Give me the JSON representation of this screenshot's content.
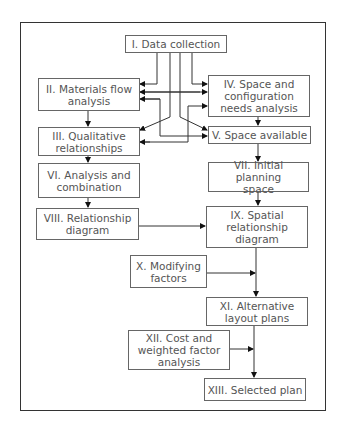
{
  "diagram": {
    "type": "flowchart",
    "nodes": [
      {
        "id": "I",
        "label": "I. Data collection"
      },
      {
        "id": "II",
        "label": "II. Materials flow\nanalysis"
      },
      {
        "id": "III",
        "label": "III. Qualitative\nrelationships"
      },
      {
        "id": "IV",
        "label": "IV. Space and\nconfiguration\nneeds analysis"
      },
      {
        "id": "V",
        "label": "V. Space available"
      },
      {
        "id": "VI",
        "label": "VI. Analysis and\ncombination"
      },
      {
        "id": "VII",
        "label": "VII. Initial planning\nspace"
      },
      {
        "id": "VIII",
        "label": "VIII. Relationship\ndiagram"
      },
      {
        "id": "IX",
        "label": "IX. Spatial\nrelationship\ndiagram"
      },
      {
        "id": "X",
        "label": "X. Modifying\nfactors"
      },
      {
        "id": "XI",
        "label": "XI. Alternative\nlayout plans"
      },
      {
        "id": "XII",
        "label": "XII. Cost and\nweighted factor\nanalysis"
      },
      {
        "id": "XIII",
        "label": "XIII. Selected plan"
      }
    ],
    "edges": [
      {
        "from": "I",
        "to": "II"
      },
      {
        "from": "I",
        "to": "III"
      },
      {
        "from": "I",
        "to": "IV"
      },
      {
        "from": "I",
        "to": "V"
      },
      {
        "from": "II",
        "to": "IV",
        "bidirectional": true
      },
      {
        "from": "II",
        "to": "V",
        "bidirectional": true
      },
      {
        "from": "III",
        "to": "IV",
        "bidirectional": true
      },
      {
        "from": "III",
        "to": "V",
        "bidirectional": true
      },
      {
        "from": "II",
        "to": "III"
      },
      {
        "from": "IV",
        "to": "V"
      },
      {
        "from": "III",
        "to": "VI"
      },
      {
        "from": "V",
        "to": "VII"
      },
      {
        "from": "VI",
        "to": "VIII"
      },
      {
        "from": "VII",
        "to": "IX"
      },
      {
        "from": "VIII",
        "to": "IX"
      },
      {
        "from": "IX",
        "to": "XI"
      },
      {
        "from": "X",
        "to": "XI"
      },
      {
        "from": "XI",
        "to": "XIII"
      },
      {
        "from": "XII",
        "to": "XIII"
      }
    ]
  }
}
